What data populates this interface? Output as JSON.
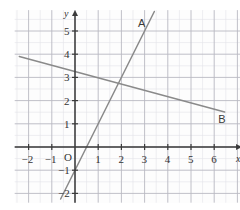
{
  "figure": {
    "kind": "coordinate-grid-line-graph",
    "width": 240,
    "height": 210,
    "background": "#ffffff"
  },
  "colors": {
    "grid_minor": "#e3e3e8",
    "grid_major": "#b9b9c2",
    "axis": "#3b3b3b",
    "line_a": "#8a8a8a",
    "line_b": "#8a8a8a",
    "text": "#333333",
    "plot_background": "#fdfdfd"
  },
  "axes": {
    "x_name": "x",
    "y_name": "y",
    "origin_label": "O",
    "x_tick_labels": [
      "-2",
      "-1",
      "1",
      "2",
      "3",
      "4",
      "5",
      "6"
    ],
    "y_tick_labels": [
      "5",
      "4",
      "3",
      "2",
      "1",
      "-1",
      "-2"
    ],
    "x_range": [
      -2.6,
      7.2
    ],
    "y_range": [
      -2.4,
      5.9
    ],
    "unit_px": 23.2,
    "origin_px": [
      75,
      147
    ],
    "grid_minor_step": 0.5,
    "grid_major_step": 1,
    "arrow_x": true,
    "arrow_y": true
  },
  "chart_data": {
    "type": "line",
    "title": "",
    "xlabel": "x",
    "ylabel": "y",
    "xlim": [
      -2.6,
      7.2
    ],
    "ylim": [
      -2.4,
      5.9
    ],
    "grid": true,
    "legend": "inline-labels",
    "series": [
      {
        "name": "A",
        "label": "A",
        "slope": 2,
        "intercept": -1,
        "equation": "y = 2x - 1",
        "x": [
          -0.62,
          3.42
        ],
        "y": [
          -2.24,
          5.84
        ],
        "label_point": [
          2.85,
          5.3
        ]
      },
      {
        "name": "B",
        "label": "B",
        "slope": -0.27,
        "intercept": 3.25,
        "equation": "y = -0.27x + 3.25",
        "x": [
          -2.4,
          6.45
        ],
        "y": [
          3.9,
          1.51
        ],
        "label_point": [
          6.3,
          1.15
        ]
      }
    ],
    "intersection": [
      2,
      2.7
    ],
    "annotations": [
      {
        "text": "A",
        "x": 2.85,
        "y": 5.3
      },
      {
        "text": "B",
        "x": 6.3,
        "y": 1.15
      }
    ]
  }
}
